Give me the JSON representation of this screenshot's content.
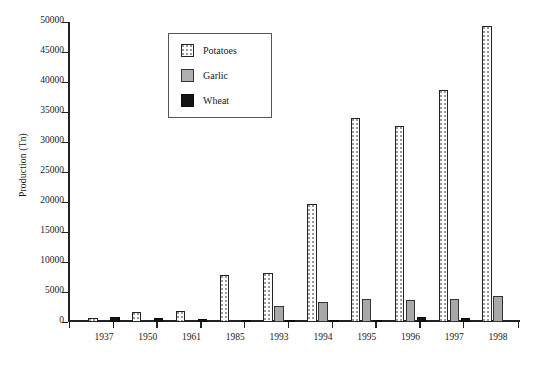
{
  "chart_data": {
    "type": "bar",
    "title": "",
    "xlabel": "",
    "ylabel": "Production (Tn)",
    "ylim": [
      0,
      50000
    ],
    "ytick_labels": [
      "0",
      "5000",
      "10000",
      "15000",
      "20000",
      "25000",
      "30000",
      "35000",
      "40000",
      "45000",
      "50000"
    ],
    "ytick_values": [
      0,
      5000,
      10000,
      15000,
      20000,
      25000,
      30000,
      35000,
      40000,
      45000,
      50000
    ],
    "grid": false,
    "legend_position": "upper-left-inside",
    "categories": [
      "1937",
      "1950",
      "1961",
      "1985",
      "1993",
      "1994",
      "1995",
      "1996",
      "1997",
      "1998"
    ],
    "series": [
      {
        "name": "Potatoes",
        "color": "#ffffff",
        "pattern": "dotted",
        "values": [
          700,
          1700,
          1800,
          7900,
          8200,
          19600,
          34000,
          32700,
          38700,
          49300
        ]
      },
      {
        "name": "Garlic",
        "color": "#a8a8a8",
        "pattern": "solid-gray",
        "values": [
          0,
          0,
          0,
          0,
          2700,
          3300,
          3800,
          3700,
          3800,
          4300
        ]
      },
      {
        "name": "Wheat",
        "color": "#141414",
        "pattern": "solid-black",
        "values": [
          800,
          750,
          500,
          200,
          150,
          300,
          250,
          800,
          700,
          0
        ]
      }
    ]
  },
  "legend": {
    "items": [
      {
        "label": "Potatoes",
        "swatch": "potatoes-swatch-icon"
      },
      {
        "label": "Garlic",
        "swatch": "garlic-swatch-icon"
      },
      {
        "label": "Wheat",
        "swatch": "wheat-swatch-icon"
      }
    ]
  }
}
